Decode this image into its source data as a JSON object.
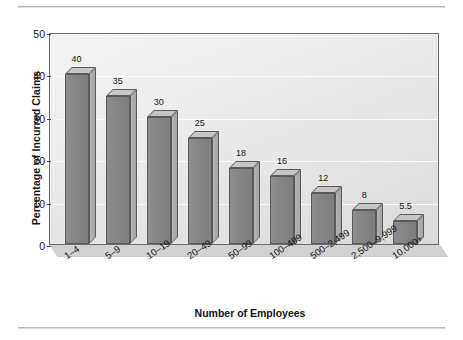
{
  "chart_data": {
    "type": "bar",
    "title": "",
    "xlabel": "Number of Employees",
    "ylabel": "Percentage of Incurred Claims",
    "categories": [
      "1–4",
      "5–9",
      "10–19",
      "20–49",
      "50–99",
      "100–499",
      "500–2,499",
      "2,500–9,999",
      "10,000+"
    ],
    "values": [
      40,
      35,
      30,
      25,
      18,
      16,
      12,
      8,
      5.5
    ],
    "data_labels": [
      "40",
      "35",
      "30",
      "25",
      "18",
      "16",
      "12",
      "8",
      "5.5"
    ],
    "ylim": [
      0,
      50
    ],
    "yticks": [
      0,
      10,
      20,
      30,
      40,
      50
    ],
    "ytick_labels": [
      "0",
      "10",
      "20",
      "30",
      "40",
      "50"
    ],
    "grid": "horizontal",
    "legend": "none",
    "style": "3d-bar",
    "bar_color": "#878787",
    "bar_top_color": "#c6c6c6",
    "bar_side_color": "#a9a9a9",
    "plot_border_color": "#6d6d6d",
    "gridline_color": "#fbfbfb",
    "text_color": "#141414"
  }
}
